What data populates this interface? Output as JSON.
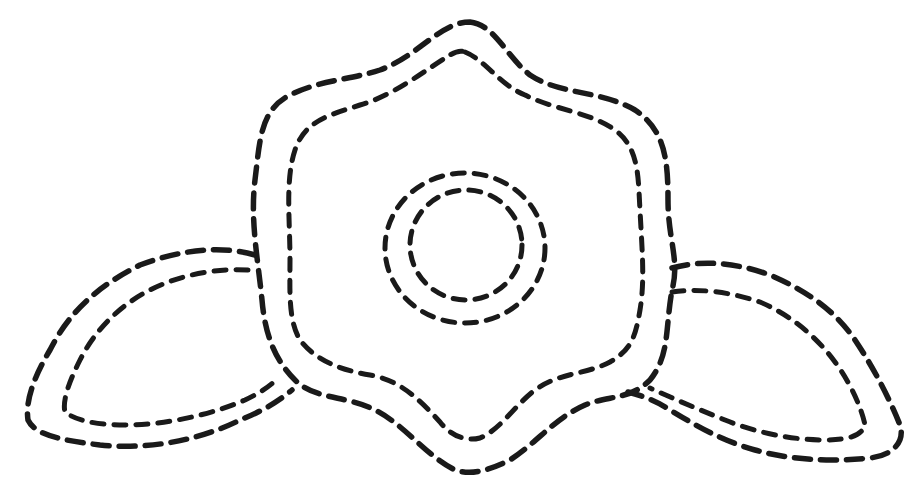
{
  "drawing": {
    "subject": "dashed-outline flower with two leaves",
    "background": "#ffffff",
    "stroke_color": "#1a1a1a",
    "style": "dashed double outline",
    "parts": [
      {
        "name": "flower-outer-outline",
        "d": "M470 22 C495 25 505 55 530 75 C560 95 600 90 635 110 C665 130 668 160 668 200 C668 240 680 260 672 290 C665 330 670 355 650 380 C630 400 610 395 585 405 C555 418 540 440 510 460 C485 472 470 475 455 470 C425 455 405 425 375 410 C345 395 315 400 295 380 C275 360 265 335 262 300 C258 260 250 220 255 180 C260 140 260 110 290 95 C320 80 350 80 380 70 C420 55 440 22 470 22 Z"
      },
      {
        "name": "flower-inner-outline",
        "d": "M465 52 C485 60 500 85 525 95 C555 110 590 112 615 130 C640 148 638 180 640 210 C642 250 645 280 640 310 C635 340 630 350 610 362 C585 375 560 372 535 390 C515 405 500 430 480 438 C465 442 450 435 440 422 C420 400 400 380 370 375 C340 370 315 360 300 340 C288 320 290 290 290 260 C290 220 285 180 295 150 C305 120 330 115 360 105 C395 95 425 70 450 55 C455 52 460 50 465 52 Z"
      },
      {
        "name": "center-outer-circle",
        "cx": 465,
        "cy": 248,
        "rx": 80,
        "ry": 75
      },
      {
        "name": "center-inner-circle",
        "cx": 466,
        "cy": 245,
        "rx": 56,
        "ry": 55
      },
      {
        "name": "left-leaf-outer-outline",
        "d": "M255 255 C220 245 180 250 140 265 C100 285 70 310 50 350 C35 375 25 400 28 420 C35 435 60 440 100 445 C150 450 200 440 240 420 C265 410 280 400 292 390"
      },
      {
        "name": "left-leaf-inner-outline",
        "d": "M248 270 C215 268 180 275 150 290 C120 305 95 330 80 360 C70 380 62 400 65 412 C75 420 95 425 125 425 C165 425 210 415 245 400 C260 393 270 386 278 378"
      },
      {
        "name": "right-leaf-outer-outline",
        "d": "M672 268 C700 260 735 262 770 275 C805 290 835 310 855 340 C875 370 890 400 900 425 C905 440 895 455 870 458 C830 462 790 460 755 450 C720 440 695 425 670 410 C655 400 640 395 628 392"
      },
      {
        "name": "right-leaf-inner-outline",
        "d": "M672 292 C700 288 730 292 760 302 C790 315 815 335 835 362 C852 385 862 410 865 425 C862 435 850 440 825 440 C790 440 755 432 725 420 C695 408 672 398 650 388"
      }
    ]
  }
}
